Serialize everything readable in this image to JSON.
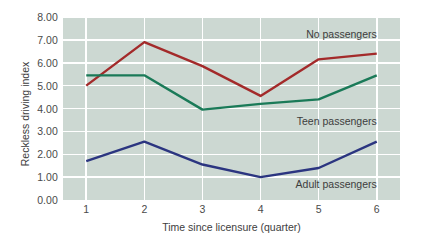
{
  "chart_data": {
    "type": "line",
    "title": "",
    "xlabel": "Time since licensure (quarter)",
    "ylabel": "Reckless driving index",
    "x": [
      1,
      2,
      3,
      4,
      5,
      6
    ],
    "categories": [
      "1",
      "2",
      "3",
      "4",
      "5",
      "6"
    ],
    "xlim": [
      0.6,
      6.4
    ],
    "ylim": [
      0,
      8
    ],
    "ytick_labels": [
      "0.00",
      "1.00",
      "2.00",
      "3.00",
      "4.00",
      "5.00",
      "6.00",
      "7.00",
      "8.00"
    ],
    "ytick_values": [
      0,
      1,
      2,
      3,
      4,
      5,
      6,
      7,
      8
    ],
    "grid": "horizontal-and-vertical-white",
    "legend_position": "inline-annotations",
    "plot_background": "#ccd8d2",
    "series": [
      {
        "name": "No passengers",
        "color": "#a32a2a",
        "values": [
          5.0,
          6.9,
          5.85,
          4.55,
          6.15,
          6.4
        ],
        "label_x": 6.0,
        "label_y": 7.25
      },
      {
        "name": "Teen passengers",
        "color": "#1a7a58",
        "values": [
          5.45,
          5.45,
          3.95,
          4.2,
          4.4,
          5.45
        ],
        "label_x": 6.0,
        "label_y": 3.45
      },
      {
        "name": "Adult passengers",
        "color": "#2b3580",
        "values": [
          1.7,
          2.55,
          1.55,
          1.0,
          1.4,
          2.55
        ],
        "label_x": 6.0,
        "label_y": 0.72
      }
    ]
  }
}
